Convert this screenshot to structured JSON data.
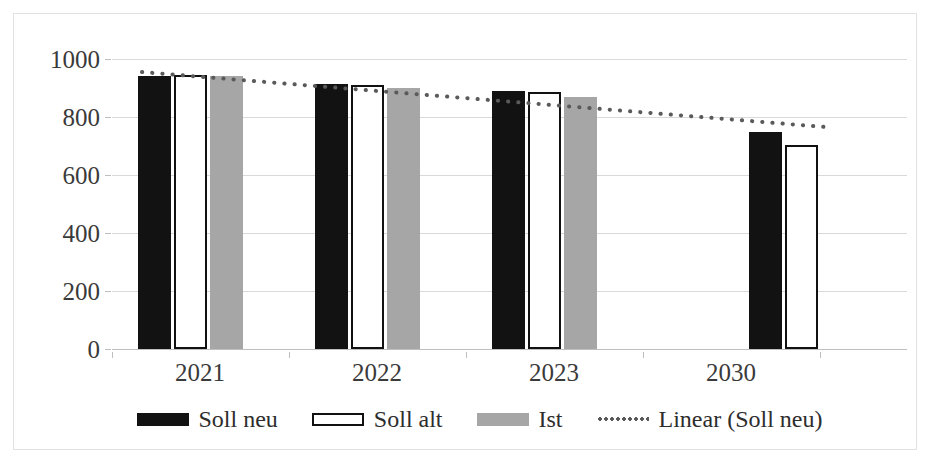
{
  "chart_data": {
    "type": "bar",
    "title": "",
    "subtitle": "",
    "xlabel": "",
    "ylabel": "",
    "categories": [
      "2021",
      "2022",
      "2023",
      "2030"
    ],
    "ylim": [
      0,
      1000
    ],
    "yticks": [
      0,
      200,
      400,
      600,
      800,
      1000
    ],
    "ytick_labels": [
      "0",
      "200",
      "400",
      "600",
      "800",
      "1000"
    ],
    "grid": true,
    "legend_position": "bottom",
    "series": [
      {
        "name": "Soll neu",
        "style": "bar",
        "color": "#121212",
        "values": [
          940,
          915,
          890,
          750
        ]
      },
      {
        "name": "Soll alt",
        "style": "bar",
        "color": "#ffffff",
        "edge_color": "#111111",
        "values": [
          945,
          912,
          885,
          703
        ]
      },
      {
        "name": "Ist",
        "style": "bar",
        "color": "#a6a6a6",
        "values": [
          940,
          900,
          870,
          null
        ]
      },
      {
        "name": "Linear (Soll neu)",
        "style": "dotted-line",
        "color": "#5a5a5a",
        "trend_start_value": 955,
        "trend_end_value": 765
      }
    ]
  },
  "legend": {
    "items": [
      {
        "label": "Soll neu",
        "swatch": "solid-black"
      },
      {
        "label": "Soll alt",
        "swatch": "outline-white"
      },
      {
        "label": "Ist",
        "swatch": "solid-gray"
      },
      {
        "label": "Linear (Soll neu)",
        "swatch": "dotted-line"
      }
    ]
  },
  "axes": {
    "y_labels": [
      "1000",
      "800",
      "600",
      "400",
      "200",
      "0"
    ],
    "x_labels": [
      "2021",
      "2022",
      "2023",
      "2030"
    ]
  }
}
